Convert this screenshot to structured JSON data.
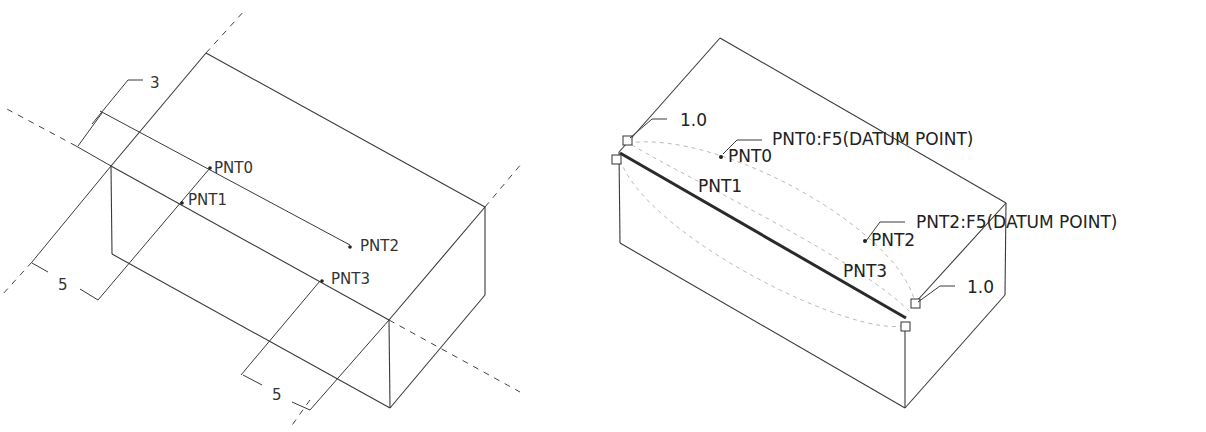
{
  "left_view": {
    "dimensions": {
      "top_offset": "3",
      "left_offset": "5",
      "bottom_offset": "5"
    },
    "points": [
      {
        "label": "PNT0"
      },
      {
        "label": "PNT1"
      },
      {
        "label": "PNT2"
      },
      {
        "label": "PNT3"
      }
    ]
  },
  "right_view": {
    "callouts": {
      "pnt0_full": "PNT0:F5(DATUM POINT)",
      "pnt2_full": "PNT2:F5(DATUM POINT)",
      "ratio_top": "1.0",
      "ratio_bottom": "1.0"
    },
    "points": [
      {
        "label": "PNT0"
      },
      {
        "label": "PNT1"
      },
      {
        "label": "PNT2"
      },
      {
        "label": "PNT3"
      }
    ]
  }
}
